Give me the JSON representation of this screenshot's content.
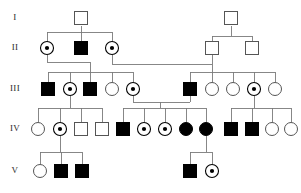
{
  "figure": {
    "kind": "pedigree-chart",
    "width": 301,
    "height": 193,
    "background": "#ffffff",
    "line_color": "#7a7a7a",
    "symbol_stroke": "#555555",
    "affected_fill": "#000000",
    "unaffected_fill": "#ffffff"
  },
  "generation_labels": [
    {
      "id": "gen-I",
      "text": "I",
      "x": 15,
      "y": 18
    },
    {
      "id": "gen-II",
      "text": "II",
      "x": 15,
      "y": 48
    },
    {
      "id": "gen-III",
      "text": "III",
      "x": 15,
      "y": 89
    },
    {
      "id": "gen-IV",
      "text": "IV",
      "x": 15,
      "y": 129
    },
    {
      "id": "gen-V",
      "text": "V",
      "x": 15,
      "y": 171
    }
  ],
  "legend_symbols": {
    "open_square": "unaffected male",
    "filled_square": "affected male",
    "open_circle": "unaffected female",
    "filled_circle": "affected female",
    "dotted_circle": "carrier female"
  },
  "individuals": [
    {
      "id": "I-1",
      "generation": "I",
      "shape": "square",
      "status": "unaffected",
      "x": 81,
      "y": 18
    },
    {
      "id": "I-2",
      "generation": "I",
      "shape": "square",
      "status": "unaffected",
      "x": 231,
      "y": 18
    },
    {
      "id": "II-1",
      "generation": "II",
      "shape": "circle",
      "status": "carrier",
      "x": 47,
      "y": 48
    },
    {
      "id": "II-2",
      "generation": "II",
      "shape": "square",
      "status": "affected",
      "x": 81,
      "y": 48
    },
    {
      "id": "II-3",
      "generation": "II",
      "shape": "circle",
      "status": "carrier",
      "x": 112,
      "y": 48
    },
    {
      "id": "II-4",
      "generation": "II",
      "shape": "square",
      "status": "unaffected",
      "x": 212,
      "y": 48
    },
    {
      "id": "II-5",
      "generation": "II",
      "shape": "square",
      "status": "unaffected",
      "x": 252,
      "y": 48
    },
    {
      "id": "III-1",
      "generation": "III",
      "shape": "square",
      "status": "affected",
      "x": 48,
      "y": 89
    },
    {
      "id": "III-2",
      "generation": "III",
      "shape": "circle",
      "status": "carrier",
      "x": 70,
      "y": 89
    },
    {
      "id": "III-3",
      "generation": "III",
      "shape": "square",
      "status": "affected",
      "x": 90,
      "y": 89
    },
    {
      "id": "III-4",
      "generation": "III",
      "shape": "circle",
      "status": "unaffected",
      "x": 112,
      "y": 89
    },
    {
      "id": "III-5",
      "generation": "III",
      "shape": "circle",
      "status": "carrier",
      "x": 133,
      "y": 89
    },
    {
      "id": "III-6",
      "generation": "III",
      "shape": "square",
      "status": "affected",
      "x": 190,
      "y": 89
    },
    {
      "id": "III-7",
      "generation": "III",
      "shape": "circle",
      "status": "unaffected",
      "x": 212,
      "y": 89
    },
    {
      "id": "III-8",
      "generation": "III",
      "shape": "circle",
      "status": "unaffected",
      "x": 233,
      "y": 89
    },
    {
      "id": "III-9",
      "generation": "III",
      "shape": "circle",
      "status": "carrier",
      "x": 254,
      "y": 89
    },
    {
      "id": "III-10",
      "generation": "III",
      "shape": "circle",
      "status": "unaffected",
      "x": 275,
      "y": 89
    },
    {
      "id": "IV-1",
      "generation": "IV",
      "shape": "circle",
      "status": "unaffected",
      "x": 38,
      "y": 129
    },
    {
      "id": "IV-2",
      "generation": "IV",
      "shape": "circle",
      "status": "carrier",
      "x": 60,
      "y": 129
    },
    {
      "id": "IV-3",
      "generation": "IV",
      "shape": "square",
      "status": "unaffected",
      "x": 81,
      "y": 129
    },
    {
      "id": "IV-4",
      "generation": "IV",
      "shape": "square",
      "status": "unaffected",
      "x": 102,
      "y": 129
    },
    {
      "id": "IV-5",
      "generation": "IV",
      "shape": "square",
      "status": "affected",
      "x": 123,
      "y": 129
    },
    {
      "id": "IV-6",
      "generation": "IV",
      "shape": "circle",
      "status": "carrier",
      "x": 144,
      "y": 129
    },
    {
      "id": "IV-7",
      "generation": "IV",
      "shape": "circle",
      "status": "carrier",
      "x": 165,
      "y": 129
    },
    {
      "id": "IV-8",
      "generation": "IV",
      "shape": "circle",
      "status": "affected",
      "x": 186,
      "y": 129
    },
    {
      "id": "IV-9",
      "generation": "IV",
      "shape": "circle",
      "status": "affected",
      "x": 206,
      "y": 129
    },
    {
      "id": "IV-10",
      "generation": "IV",
      "shape": "square",
      "status": "affected",
      "x": 231,
      "y": 129
    },
    {
      "id": "IV-11",
      "generation": "IV",
      "shape": "square",
      "status": "affected",
      "x": 252,
      "y": 129
    },
    {
      "id": "IV-12",
      "generation": "IV",
      "shape": "circle",
      "status": "unaffected",
      "x": 272,
      "y": 129
    },
    {
      "id": "IV-13",
      "generation": "IV",
      "shape": "circle",
      "status": "unaffected",
      "x": 291,
      "y": 129
    },
    {
      "id": "V-1",
      "generation": "V",
      "shape": "circle",
      "status": "unaffected",
      "x": 40,
      "y": 171
    },
    {
      "id": "V-2",
      "generation": "V",
      "shape": "square",
      "status": "affected",
      "x": 61,
      "y": 171
    },
    {
      "id": "V-3",
      "generation": "V",
      "shape": "square",
      "status": "affected",
      "x": 82,
      "y": 171
    },
    {
      "id": "V-4",
      "generation": "V",
      "shape": "square",
      "status": "affected",
      "x": 190,
      "y": 171
    },
    {
      "id": "V-5",
      "generation": "V",
      "shape": "circle",
      "status": "carrier",
      "x": 212,
      "y": 171
    }
  ],
  "connectors": [
    {
      "id": "I1-down",
      "points": "81,26 81,48"
    },
    {
      "id": "II-sib-bar-1",
      "points": "47,32 112,32"
    },
    {
      "id": "II1-up",
      "points": "47,32 47,42"
    },
    {
      "id": "II3-up",
      "points": "112,32 112,42"
    },
    {
      "id": "I2-down",
      "points": "231,26 231,36"
    },
    {
      "id": "II-sib-bar-2",
      "points": "212,36 252,36"
    },
    {
      "id": "II4-up",
      "points": "212,36 212,42"
    },
    {
      "id": "II5-up",
      "points": "252,36 252,42"
    },
    {
      "id": "mate-1-drop-a",
      "points": "47,55 47,62"
    },
    {
      "id": "mate-1-bar",
      "points": "47,62 90,62"
    },
    {
      "id": "mate-1-drop-b",
      "points": "90,62 90,72"
    },
    {
      "id": "III-sib-bar-L",
      "points": "48,72 133,72"
    },
    {
      "id": "III1-up",
      "points": "48,72 48,82"
    },
    {
      "id": "III2-up",
      "points": "70,72 70,82"
    },
    {
      "id": "III3-up",
      "points": "90,72 90,82"
    },
    {
      "id": "III4-up",
      "points": "112,72 112,82"
    },
    {
      "id": "III5-up",
      "points": "133,72 133,82"
    },
    {
      "id": "mate-2-drop-a",
      "points": "112,55 112,64"
    },
    {
      "id": "mate-2-long-bar",
      "points": "112,64 212,64"
    },
    {
      "id": "mate-2-drop-b",
      "points": "212,55 212,72"
    },
    {
      "id": "III-sib-bar-R",
      "points": "190,72 275,72"
    },
    {
      "id": "III6-up",
      "points": "190,72 190,82"
    },
    {
      "id": "III7-up",
      "points": "212,72 212,82"
    },
    {
      "id": "III8-up",
      "points": "233,72 233,82"
    },
    {
      "id": "III9-up",
      "points": "254,72 254,82"
    },
    {
      "id": "III10-up",
      "points": "275,72 275,82"
    },
    {
      "id": "mate-3-drop-a",
      "points": "70,96 70,108"
    },
    {
      "id": "IV-sib-bar-1",
      "points": "38,108 102,108"
    },
    {
      "id": "IV1-up",
      "points": "38,108 38,122"
    },
    {
      "id": "IV2-up",
      "points": "60,108 60,122"
    },
    {
      "id": "IV3-up",
      "points": "81,108 81,122"
    },
    {
      "id": "IV4-up",
      "points": "102,108 102,122"
    },
    {
      "id": "mate-4-drop-a",
      "points": "133,96 133,102"
    },
    {
      "id": "mate-4-bar",
      "points": "133,102 190,102"
    },
    {
      "id": "mate-4-drop-b",
      "points": "190,96 190,102"
    },
    {
      "id": "mate-4-down",
      "points": "160,102 160,108"
    },
    {
      "id": "IV-sib-bar-2",
      "points": "123,108 206,108"
    },
    {
      "id": "IV5-up",
      "points": "123,108 123,122"
    },
    {
      "id": "IV6-up",
      "points": "144,108 144,122"
    },
    {
      "id": "IV7-up",
      "points": "165,108 165,122"
    },
    {
      "id": "IV8-up",
      "points": "186,108 186,122"
    },
    {
      "id": "IV9-up",
      "points": "206,108 206,122"
    },
    {
      "id": "mate-5-drop-a",
      "points": "254,96 254,108"
    },
    {
      "id": "IV-sib-bar-3",
      "points": "231,108 291,108"
    },
    {
      "id": "IV10-up",
      "points": "231,108 231,122"
    },
    {
      "id": "IV11-up",
      "points": "252,108 252,122"
    },
    {
      "id": "IV12-up",
      "points": "272,108 272,122"
    },
    {
      "id": "IV13-up",
      "points": "291,108 291,122"
    },
    {
      "id": "mate-6-drop",
      "points": "60,136 60,152"
    },
    {
      "id": "V-sib-bar-1",
      "points": "40,152 82,152"
    },
    {
      "id": "V1-up",
      "points": "40,152 40,164"
    },
    {
      "id": "V2-up",
      "points": "61,152 61,164"
    },
    {
      "id": "V3-up",
      "points": "82,152 82,164"
    },
    {
      "id": "mate-7-drop",
      "points": "206,136 206,152"
    },
    {
      "id": "V-sib-bar-2",
      "points": "190,152 212,152"
    },
    {
      "id": "V4-up",
      "points": "190,152 190,164"
    },
    {
      "id": "V5-up",
      "points": "212,152 212,164"
    }
  ]
}
